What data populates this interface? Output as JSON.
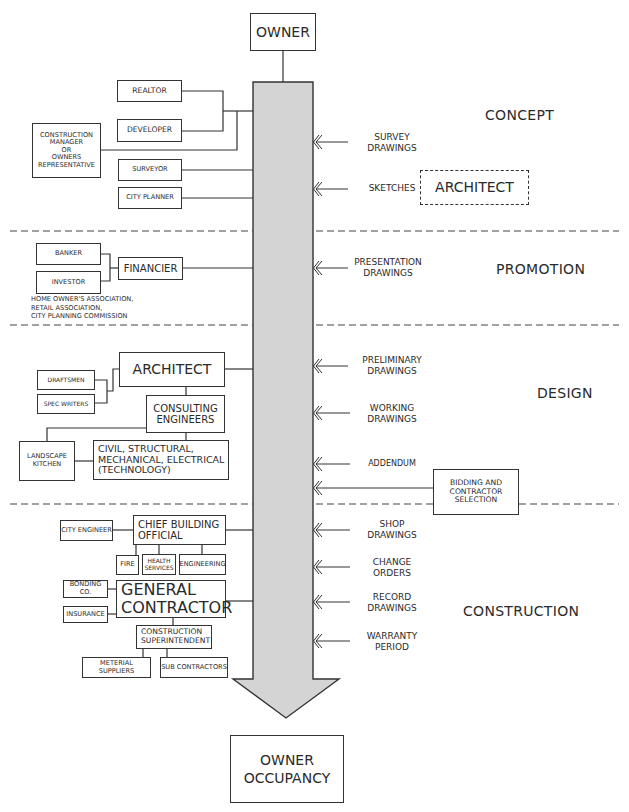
{
  "diagram": {
    "title_top": "OWNER",
    "title_bottom": "OWNER\nOCCUPANCY",
    "colors": {
      "bar_fill": "#d4d4d4",
      "stroke": "#333333",
      "background": "#ffffff"
    },
    "phases": [
      {
        "id": "concept",
        "label": "CONCEPT"
      },
      {
        "id": "promotion",
        "label": "PROMOTION"
      },
      {
        "id": "design",
        "label": "DESIGN"
      },
      {
        "id": "construction",
        "label": "CONSTRUCTION"
      }
    ],
    "concept": {
      "realtor": "REALTOR",
      "developer": "DEVELOPER",
      "construction_manager": "CONSTRUCTION\nMANAGER\nOR\nOWNERS\nREPRESENTATIVE",
      "surveyor": "SURVEYOR",
      "city_planner": "CITY PLANNER",
      "architect_dashed": "ARCHITECT"
    },
    "promotion": {
      "banker": "BANKER",
      "investor": "INVESTOR",
      "financier": "FINANCIER",
      "note": "HOME OWNER'S ASSOCIATION,\nRETAIL ASSOCIATION,\nCITY PLANNING COMMISSION"
    },
    "design": {
      "architect": "ARCHITECT",
      "draftsmen": "DRAFTSMEN",
      "spec_writers": "SPEC WRITERS",
      "consulting_engineers": "CONSULTING\nENGINEERS",
      "landscape_kitchen": "LANDSCAPE\nKITCHEN",
      "technology": "CIVIL, STRUCTURAL,\nMECHANICAL, ELECTRICAL\n(TECHNOLOGY)",
      "bidding": "BIDDING AND\nCONTRACTOR\nSELECTION"
    },
    "construction": {
      "city_engineer": "CITY ENGINEER",
      "chief_building_official": "CHIEF BUILDING\nOFFICIAL",
      "fire": "FIRE",
      "health_services": "HEALTH\nSERVICES",
      "engineering": "ENGINEERING",
      "bonding": "BONDING CO.",
      "insurance": "INSURANCE",
      "general_contractor": "GENERAL\nCONTRACTOR",
      "superintendent": "CONSTRUCTION\nSUPERINTENDENT",
      "material_suppliers": "METERIAL SUPPLIERS",
      "sub_contractors": "SUB CONTRACTORS"
    },
    "documents": [
      {
        "label": "SURVEY\nDRAWINGS"
      },
      {
        "label": "SKETCHES"
      },
      {
        "label": "PRESENTATION\nDRAWINGS"
      },
      {
        "label": "PRELIMINARY\nDRAWINGS"
      },
      {
        "label": "WORKING\nDRAWINGS"
      },
      {
        "label": "ADDENDUM"
      },
      {
        "label": "SHOP\nDRAWINGS"
      },
      {
        "label": "CHANGE\nORDERS"
      },
      {
        "label": "RECORD\nDRAWINGS"
      },
      {
        "label": "WARRANTY\nPERIOD"
      }
    ]
  }
}
